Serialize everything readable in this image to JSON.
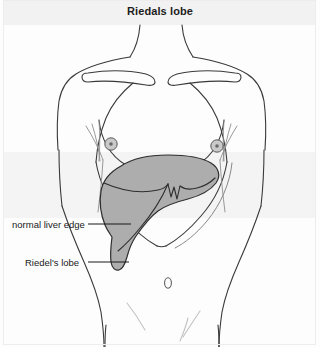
{
  "figure": {
    "title": "Riedals lobe",
    "domain": "anatomical-illustration",
    "background_color": "#fdfdfd",
    "header_band_color": "#f2f2f2",
    "outline_color": "#3a3a3a",
    "liver_fill_color": "#adadad",
    "liver_stroke_color": "#2e2e2e",
    "leader_line_color": "#1a1a1a",
    "label_text_color": "#1a1a1a"
  },
  "annotations": [
    {
      "id": "normal-liver-edge",
      "label": "normal liver edge",
      "leader_from_x": 88,
      "leader_to_x": 131,
      "leader_y": 224
    },
    {
      "id": "riedels-lobe",
      "label": "Riedel's lobe",
      "leader_from_x": 88,
      "leader_to_x": 129,
      "leader_y": 262
    }
  ],
  "anatomy_parts": [
    {
      "name": "neck",
      "visible": true
    },
    {
      "name": "left-shoulder",
      "visible": true
    },
    {
      "name": "right-shoulder",
      "visible": true
    },
    {
      "name": "left-clavicle",
      "visible": true
    },
    {
      "name": "right-clavicle",
      "visible": true
    },
    {
      "name": "sternum-ribcage",
      "visible": true
    },
    {
      "name": "left-breast",
      "visible": true
    },
    {
      "name": "right-breast",
      "visible": true
    },
    {
      "name": "left-nipple",
      "visible": true
    },
    {
      "name": "right-nipple",
      "visible": true
    },
    {
      "name": "left-costal-margin",
      "visible": true
    },
    {
      "name": "right-costal-margin",
      "visible": true
    },
    {
      "name": "liver",
      "visible": true
    },
    {
      "name": "riedels-lobe-extension",
      "visible": true
    },
    {
      "name": "umbilicus",
      "visible": true
    },
    {
      "name": "left-inguinal-crease",
      "visible": true
    },
    {
      "name": "right-inguinal-crease",
      "visible": true
    },
    {
      "name": "left-thigh",
      "visible": true
    },
    {
      "name": "right-thigh",
      "visible": true
    }
  ]
}
